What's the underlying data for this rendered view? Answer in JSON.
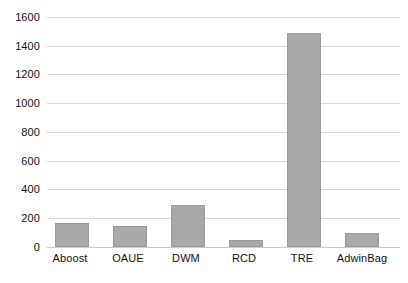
{
  "chart_data": {
    "type": "bar",
    "title": "",
    "subtitle": "",
    "xlabel": "",
    "ylabel": "",
    "categories": [
      "Aboost",
      "OAUE",
      "DWM",
      "RCD",
      "TRE",
      "AdwinBag"
    ],
    "values": [
      170,
      148,
      290,
      47,
      1490,
      100
    ],
    "ylim": [
      0,
      1600
    ],
    "ytick_labels": [
      "0",
      "200",
      "400",
      "600",
      "800",
      "1000",
      "1200",
      "1400",
      "1600"
    ],
    "ytick_values": [
      0,
      200,
      400,
      600,
      800,
      1000,
      1200,
      1400,
      1600
    ],
    "grid": true,
    "legend": false,
    "legend_position": "none",
    "bar_color": "#a9a9a9",
    "bar_border_color": "#9a9a9a",
    "gridline_color": "#d8d8d8",
    "background_color": "#ffffff",
    "text_color": "#111111"
  }
}
